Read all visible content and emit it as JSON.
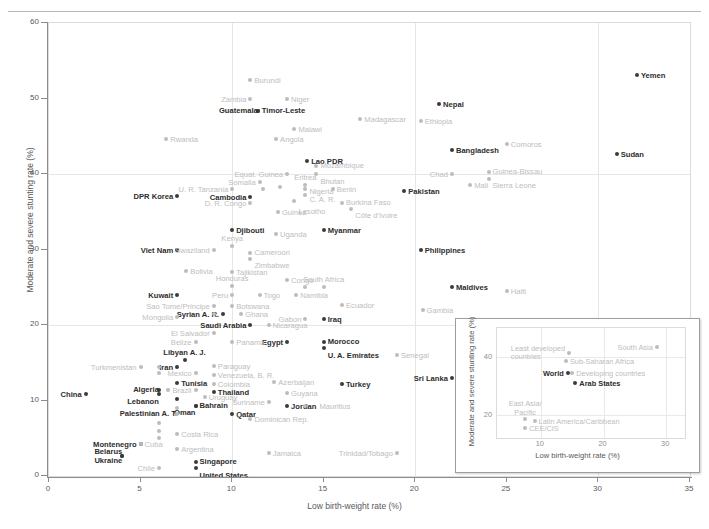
{
  "chart_data": {
    "type": "scatter",
    "title": "",
    "xlabel": "Low birth-weight rate (%)",
    "ylabel": "Moderate and severe stunting rate (%)",
    "xlim": [
      0,
      35
    ],
    "ylim": [
      0,
      60
    ],
    "xticks": [
      0,
      5,
      10,
      15,
      20,
      25,
      30,
      35
    ],
    "yticks": [
      0,
      10,
      20,
      30,
      40,
      50,
      60
    ],
    "gridlines": {
      "x": [
        10,
        20,
        30
      ],
      "y": [
        20,
        40
      ]
    },
    "legend": "none",
    "series": [
      {
        "name": "Highlighted countries",
        "emphasis": "dark",
        "color": "#3b3b3b",
        "points": [
          {
            "label": "Yemen",
            "x": 32.1,
            "y": 53.1,
            "pos": "right"
          },
          {
            "label": "Sudan",
            "x": 31.0,
            "y": 42.7,
            "pos": "right"
          },
          {
            "label": "Timor-Leste",
            "x": 11.4,
            "y": 48.3,
            "pos": "right"
          },
          {
            "label": "Guatemala",
            "x": 11.4,
            "y": 48.3,
            "pos": "left"
          },
          {
            "label": "Lao PDR",
            "x": 14.1,
            "y": 41.7,
            "pos": "right"
          },
          {
            "label": "Nepal",
            "x": 21.3,
            "y": 49.3,
            "pos": "right"
          },
          {
            "label": "Bangladesh",
            "x": 22.0,
            "y": 43.2,
            "pos": "right"
          },
          {
            "label": "Pakistan",
            "x": 19.4,
            "y": 37.8,
            "pos": "right"
          },
          {
            "label": "Cambodia",
            "x": 11.0,
            "y": 37.0,
            "pos": "left"
          },
          {
            "label": "DPR Korea",
            "x": 7.0,
            "y": 37.1,
            "pos": "left"
          },
          {
            "label": "Djibouti",
            "x": 10.0,
            "y": 32.6,
            "pos": "right"
          },
          {
            "label": "Myanmar",
            "x": 15.0,
            "y": 32.6,
            "pos": "right"
          },
          {
            "label": "Viet Nam",
            "x": 7.0,
            "y": 29.9,
            "pos": "left"
          },
          {
            "label": "Philippines",
            "x": 20.3,
            "y": 30.0,
            "pos": "right"
          },
          {
            "label": "Kuwait",
            "x": 7.0,
            "y": 24.0,
            "pos": "left"
          },
          {
            "label": "Syrian A. R.",
            "x": 9.5,
            "y": 21.4,
            "pos": "left"
          },
          {
            "label": "Saudi Arabia",
            "x": 11.0,
            "y": 20.0,
            "pos": "left"
          },
          {
            "label": "Iraq",
            "x": 15.0,
            "y": 20.8,
            "pos": "right"
          },
          {
            "label": "Egypt",
            "x": 13.0,
            "y": 17.8,
            "pos": "left"
          },
          {
            "label": "Morocco",
            "x": 15.0,
            "y": 17.8,
            "pos": "right"
          },
          {
            "label": "U. A. Emirates",
            "x": 15.0,
            "y": 17.0,
            "pos": "right"
          },
          {
            "label": "Libyan A. J.",
            "x": 7.4,
            "y": 15.4,
            "pos": "above"
          },
          {
            "label": "Iran",
            "x": 7.0,
            "y": 14.5,
            "pos": "left"
          },
          {
            "label": "Tunisia",
            "x": 7.0,
            "y": 12.3,
            "pos": "right"
          },
          {
            "label": "Algeria",
            "x": 6.0,
            "y": 11.4,
            "pos": "left"
          },
          {
            "label": "Lebanon",
            "x": 6.0,
            "y": 10.8,
            "pos": "left"
          },
          {
            "label": "Palestinian A. T.",
            "x": 7.0,
            "y": 10.2,
            "pos": "left"
          },
          {
            "label": "Thailand",
            "x": 9.0,
            "y": 11.1,
            "pos": "right"
          },
          {
            "label": "Bahrain",
            "x": 8.0,
            "y": 9.3,
            "pos": "right"
          },
          {
            "label": "Oman",
            "x": 8.0,
            "y": 9.3,
            "pos": "left"
          },
          {
            "label": "Qatar",
            "x": 10.0,
            "y": 8.2,
            "pos": "right"
          },
          {
            "label": "Jordan",
            "x": 13.0,
            "y": 9.3,
            "pos": "right"
          },
          {
            "label": "Turkey",
            "x": 16.0,
            "y": 12.2,
            "pos": "right"
          },
          {
            "label": "China",
            "x": 2.0,
            "y": 10.8,
            "pos": "left"
          },
          {
            "label": "Sri Lanka",
            "x": 22.0,
            "y": 13.0,
            "pos": "left"
          },
          {
            "label": "Maldives",
            "x": 22.0,
            "y": 25.0,
            "pos": "right"
          },
          {
            "label": "Montenegro",
            "x": 5.0,
            "y": 4.3,
            "pos": "left"
          },
          {
            "label": "Belarus",
            "x": 4.0,
            "y": 2.7,
            "pos": "left"
          },
          {
            "label": "Ukraine",
            "x": 4.0,
            "y": 2.7,
            "pos": "left"
          },
          {
            "label": "Singapore",
            "x": 8.0,
            "y": 1.8,
            "pos": "right"
          },
          {
            "label": "United States",
            "x": 8.0,
            "y": 1.0,
            "pos": "right"
          }
        ]
      },
      {
        "name": "Other countries",
        "emphasis": "light",
        "color": "#bcbcbc",
        "points": [
          {
            "label": "Burundi",
            "x": 11.0,
            "y": 52.5,
            "pos": "right"
          },
          {
            "label": "Zambia",
            "x": 11.0,
            "y": 50.0,
            "pos": "left"
          },
          {
            "label": "Niger",
            "x": 13.0,
            "y": 50.0,
            "pos": "right"
          },
          {
            "label": "Malawi",
            "x": 13.4,
            "y": 46.0,
            "pos": "right"
          },
          {
            "label": "Angola",
            "x": 12.4,
            "y": 44.6,
            "pos": "right"
          },
          {
            "label": "Rwanda",
            "x": 6.4,
            "y": 44.7,
            "pos": "right"
          },
          {
            "label": "Madagascar",
            "x": 17.0,
            "y": 47.3,
            "pos": "right"
          },
          {
            "label": "Ethiopia",
            "x": 20.3,
            "y": 47.0,
            "pos": "right"
          },
          {
            "label": "Comoros",
            "x": 25.0,
            "y": 44.0,
            "pos": "right"
          },
          {
            "label": "Mozambique",
            "x": 14.6,
            "y": 41.0,
            "pos": "right"
          },
          {
            "label": "Bhutan",
            "x": 14.6,
            "y": 40.0,
            "pos": "right"
          },
          {
            "label": "Equat. Guinea",
            "x": 13.0,
            "y": 40.0,
            "pos": "left"
          },
          {
            "label": "Chad",
            "x": 22.0,
            "y": 40.0,
            "pos": "left"
          },
          {
            "label": "Guinea-Bissau",
            "x": 24.0,
            "y": 40.3,
            "pos": "right"
          },
          {
            "label": "Sierra Leone",
            "x": 24.0,
            "y": 39.3,
            "pos": "right"
          },
          {
            "label": "Somalia",
            "x": 11.5,
            "y": 38.9,
            "pos": "left"
          },
          {
            "label": "Eritrea",
            "x": 14.0,
            "y": 38.5,
            "pos": "above"
          },
          {
            "label": "U. R. Tanzania",
            "x": 10.0,
            "y": 38.0,
            "pos": "left"
          },
          {
            "label": "Nigeria",
            "x": 14.0,
            "y": 38.0,
            "pos": "right"
          },
          {
            "label": "Benin",
            "x": 15.5,
            "y": 38.0,
            "pos": "right"
          },
          {
            "label": "C. A. R.",
            "x": 14.0,
            "y": 37.2,
            "pos": "right"
          },
          {
            "label": "Lesotho",
            "x": 13.4,
            "y": 36.4,
            "pos": "right"
          },
          {
            "label": "Mali",
            "x": 23.0,
            "y": 38.5,
            "pos": "right"
          },
          {
            "label": "D. R. Congo",
            "x": 11.0,
            "y": 36.2,
            "pos": "left"
          },
          {
            "label": "Guinea",
            "x": 12.5,
            "y": 35.0,
            "pos": "right"
          },
          {
            "label": "Burkina Faso",
            "x": 16.0,
            "y": 36.2,
            "pos": "right"
          },
          {
            "label": "Côte d'Ivoire",
            "x": 16.5,
            "y": 35.4,
            "pos": "right"
          },
          {
            "label": "Uganda",
            "x": 12.4,
            "y": 32.0,
            "pos": "right"
          },
          {
            "label": "Kenya",
            "x": 10.0,
            "y": 30.5,
            "pos": "above"
          },
          {
            "label": "Swaziland",
            "x": 9.0,
            "y": 30.0,
            "pos": "left"
          },
          {
            "label": "Cameroon",
            "x": 11.0,
            "y": 29.5,
            "pos": "right"
          },
          {
            "label": "Zimbabwe",
            "x": 11.0,
            "y": 28.8,
            "pos": "right"
          },
          {
            "label": "Bolivia",
            "x": 7.5,
            "y": 27.1,
            "pos": "right"
          },
          {
            "label": "Tajikistan",
            "x": 10.0,
            "y": 27.0,
            "pos": "right"
          },
          {
            "label": "Honduras",
            "x": 10.0,
            "y": 25.2,
            "pos": "above"
          },
          {
            "label": "Congo",
            "x": 13.0,
            "y": 26.0,
            "pos": "right"
          },
          {
            "label": "South Africa",
            "x": 15.0,
            "y": 25.0,
            "pos": "above"
          },
          {
            "label": "Peru",
            "x": 10.0,
            "y": 24.0,
            "pos": "left"
          },
          {
            "label": "Togo",
            "x": 11.5,
            "y": 24.0,
            "pos": "right"
          },
          {
            "label": "Namibia",
            "x": 13.5,
            "y": 24.0,
            "pos": "right"
          },
          {
            "label": "Ecuador",
            "x": 16.0,
            "y": 22.6,
            "pos": "right"
          },
          {
            "label": "Sao Tome/Principe",
            "x": 9.0,
            "y": 22.5,
            "pos": "left"
          },
          {
            "label": "Botswana",
            "x": 10.0,
            "y": 22.5,
            "pos": "right"
          },
          {
            "label": "Ghana",
            "x": 10.5,
            "y": 21.5,
            "pos": "right"
          },
          {
            "label": "Mongolia",
            "x": 7.0,
            "y": 21.0,
            "pos": "left"
          },
          {
            "label": "Gabon",
            "x": 14.0,
            "y": 20.8,
            "pos": "left"
          },
          {
            "label": "Nicaragua",
            "x": 12.0,
            "y": 20.0,
            "pos": "right"
          },
          {
            "label": "Gambia",
            "x": 20.4,
            "y": 22.0,
            "pos": "right"
          },
          {
            "label": "Haiti",
            "x": 25.0,
            "y": 24.5,
            "pos": "right"
          },
          {
            "label": "El Salvador",
            "x": 9.0,
            "y": 19.0,
            "pos": "left"
          },
          {
            "label": "Belize",
            "x": 8.0,
            "y": 17.8,
            "pos": "left"
          },
          {
            "label": "Panama",
            "x": 10.0,
            "y": 17.8,
            "pos": "right"
          },
          {
            "label": "Senegal",
            "x": 19.0,
            "y": 16.0,
            "pos": "right"
          },
          {
            "label": "Turkmenistan",
            "x": 5.0,
            "y": 14.5,
            "pos": "left"
          },
          {
            "label": "Paraguay",
            "x": 9.0,
            "y": 14.6,
            "pos": "right"
          },
          {
            "label": "Mexico",
            "x": 8.0,
            "y": 13.6,
            "pos": "left"
          },
          {
            "label": "Venezuela, B. R.",
            "x": 9.0,
            "y": 13.4,
            "pos": "right"
          },
          {
            "label": "Colombia",
            "x": 9.0,
            "y": 12.2,
            "pos": "right"
          },
          {
            "label": "Azerbaijan",
            "x": 12.3,
            "y": 12.4,
            "pos": "right"
          },
          {
            "label": "Brazil",
            "x": 8.0,
            "y": 11.4,
            "pos": "left"
          },
          {
            "label": "Uruguay",
            "x": 8.5,
            "y": 10.5,
            "pos": "right"
          },
          {
            "label": "Guyana",
            "x": 13.0,
            "y": 11.0,
            "pos": "right"
          },
          {
            "label": "Suriname",
            "x": 12.0,
            "y": 9.8,
            "pos": "left"
          },
          {
            "label": "Mauritius",
            "x": 14.0,
            "y": 9.3,
            "pos": "right"
          },
          {
            "label": "Dominican Rep.",
            "x": 11.0,
            "y": 7.5,
            "pos": "right"
          },
          {
            "label": "Costa Rica",
            "x": 7.0,
            "y": 5.6,
            "pos": "right"
          },
          {
            "label": "Cuba",
            "x": 5.0,
            "y": 4.3,
            "pos": "right"
          },
          {
            "label": "Argentina",
            "x": 7.0,
            "y": 3.6,
            "pos": "right"
          },
          {
            "label": "Jamaica",
            "x": 12.0,
            "y": 3.0,
            "pos": "right"
          },
          {
            "label": "Trinidad/Tobago",
            "x": 19.0,
            "y": 3.0,
            "pos": "left"
          },
          {
            "label": "Chile",
            "x": 6.0,
            "y": 1.0,
            "pos": "left"
          },
          {
            "label": "",
            "x": 6.0,
            "y": 14.5,
            "pos": "right"
          },
          {
            "label": "",
            "x": 6.0,
            "y": 13.6,
            "pos": "right"
          },
          {
            "label": "",
            "x": 6.5,
            "y": 11.4,
            "pos": "right"
          },
          {
            "label": "",
            "x": 7.0,
            "y": 9.0,
            "pos": "right"
          },
          {
            "label": "",
            "x": 7.0,
            "y": 8.2,
            "pos": "right"
          },
          {
            "label": "",
            "x": 6.0,
            "y": 7.0,
            "pos": "right"
          },
          {
            "label": "",
            "x": 6.0,
            "y": 6.0,
            "pos": "right"
          },
          {
            "label": "",
            "x": 6.0,
            "y": 5.0,
            "pos": "right"
          },
          {
            "label": "",
            "x": 9.0,
            "y": 21.5,
            "pos": "right"
          },
          {
            "label": "",
            "x": 14.0,
            "y": 25.0,
            "pos": "right"
          },
          {
            "label": "",
            "x": 11.7,
            "y": 38.0,
            "pos": "right"
          },
          {
            "label": "",
            "x": 12.6,
            "y": 38.3,
            "pos": "right"
          }
        ]
      }
    ]
  },
  "inset": {
    "chart_data": {
      "type": "scatter",
      "xlabel": "Low birth-weight rate (%)",
      "ylabel": "Moderate and severe stunting rate (%)",
      "xlim": [
        3,
        33
      ],
      "ylim": [
        12,
        50
      ],
      "xticks": [
        10,
        20,
        30
      ],
      "yticks": [
        20,
        40
      ],
      "points": [
        {
          "label": "South Asia",
          "x": 28.5,
          "y": 43.5,
          "emphasis": "light",
          "pos": "left"
        },
        {
          "label": "Least developed countries",
          "x": 14.5,
          "y": 41.5,
          "emphasis": "light",
          "pos": "two-left"
        },
        {
          "label": "Sub-Saharan Africa",
          "x": 14.0,
          "y": 38.5,
          "emphasis": "light",
          "pos": "right"
        },
        {
          "label": "Developing countries",
          "x": 15.0,
          "y": 34.5,
          "emphasis": "light",
          "pos": "right"
        },
        {
          "label": "World",
          "x": 14.3,
          "y": 34.5,
          "emphasis": "dark",
          "pos": "left"
        },
        {
          "label": "Arab States",
          "x": 15.5,
          "y": 31.0,
          "emphasis": "dark",
          "pos": "right"
        },
        {
          "label": "East Asia/ Pacific",
          "x": 7.5,
          "y": 18.5,
          "emphasis": "light",
          "pos": "two-above"
        },
        {
          "label": "Latin America/Caribbean",
          "x": 9.0,
          "y": 18.0,
          "emphasis": "light",
          "pos": "right"
        },
        {
          "label": "CEE/CIS",
          "x": 7.5,
          "y": 15.5,
          "emphasis": "light",
          "pos": "right"
        }
      ]
    }
  }
}
